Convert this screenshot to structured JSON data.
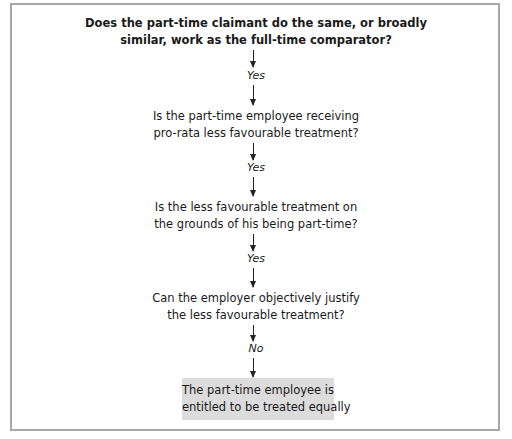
{
  "flowchart": {
    "steps": [
      {
        "question_lines": [
          "Does the part-time claimant do the same, or broadly",
          "similar, work as the full-time comparator?"
        ],
        "answer": "Yes"
      },
      {
        "question_lines": [
          "Is the part-time employee receiving",
          "pro-rata less favourable treatment?"
        ],
        "answer": "Yes"
      },
      {
        "question_lines": [
          "Is the less favourable treatment on",
          "the grounds of his being part-time?"
        ],
        "answer": "Yes"
      },
      {
        "question_lines": [
          "Can the employer objectively justify",
          "the less favourable treatment?"
        ],
        "answer": "No"
      }
    ],
    "outcome_lines": [
      "The part-time employee is",
      "entitled to be treated equally"
    ],
    "colors": {
      "frame_border": "#a8a8a8",
      "outcome_box": "#dcdcdc",
      "text": "#1a1a1a"
    }
  }
}
